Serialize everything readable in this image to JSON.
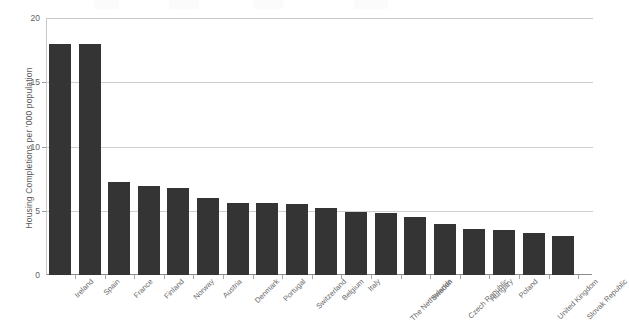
{
  "chart_data": {
    "type": "bar",
    "title": "",
    "xlabel": "",
    "ylabel": "Housing Completions per '000 population",
    "ylim": [
      0,
      20
    ],
    "yticks": [
      0,
      5,
      10,
      15,
      20
    ],
    "ytick_labels": [
      "0",
      "5",
      "10",
      "15",
      "20"
    ],
    "grid": true,
    "legend": "none",
    "bar_color": "#343434",
    "categories": [
      "Ireland",
      "Spain",
      "France",
      "Finland",
      "Norway",
      "Austria",
      "Denmark",
      "Portugal",
      "Switzerland",
      "Belgium",
      "Italy",
      "The Netherlands",
      "Sweden",
      "Czech Republic",
      "Hungary",
      "Poland",
      "United Kingdom",
      "Slovak Republic"
    ],
    "values": [
      18.0,
      18.0,
      7.2,
      6.9,
      6.8,
      6.0,
      5.6,
      5.6,
      5.5,
      5.2,
      4.9,
      4.8,
      4.5,
      4.0,
      3.6,
      3.5,
      3.3,
      3.0
    ]
  }
}
